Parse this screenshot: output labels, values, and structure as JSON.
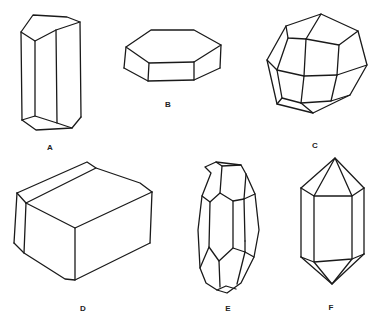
{
  "figure": {
    "type": "crystal-habit-drawings",
    "stroke_color": "#1a1a1a",
    "background": "#ffffff",
    "crystals": [
      {
        "label": "A",
        "shape": "elongated hexagonal prism",
        "label_pos": [
          50,
          147
        ]
      },
      {
        "label": "B",
        "shape": "tabular hexagonal prism",
        "label_pos": [
          168,
          104
        ]
      },
      {
        "label": "C",
        "shape": "equant polyhedron",
        "label_pos": [
          315,
          145
        ]
      },
      {
        "label": "D",
        "shape": "blocky prism with bevelled edges",
        "label_pos": [
          83,
          308
        ]
      },
      {
        "label": "E",
        "shape": "barrel-shaped polyhedron",
        "label_pos": [
          228,
          308
        ]
      },
      {
        "label": "F",
        "shape": "doubly-terminated prism",
        "label_pos": [
          331,
          307
        ]
      }
    ]
  }
}
